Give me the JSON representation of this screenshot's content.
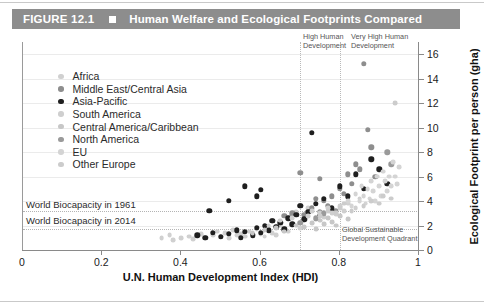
{
  "figure": {
    "number": "FIGURE 12.1",
    "marker": "square-marker",
    "title": "Human Welfare and Ecological Footprints Compared"
  },
  "legend": {
    "items": [
      {
        "label": "Africa",
        "color": "#d0d0d0"
      },
      {
        "label": "Middle East/Central Asia",
        "color": "#8e8e8e"
      },
      {
        "label": "Asia-Pacific",
        "color": "#1f1f1f"
      },
      {
        "label": "South America",
        "color": "#cfcfcf"
      },
      {
        "label": "Central America/Caribbean",
        "color": "#c7c7c7"
      },
      {
        "label": "North America",
        "color": "#9a9a9a"
      },
      {
        "label": "EU",
        "color": "#d4d4d4"
      },
      {
        "label": "Other Europe",
        "color": "#cccccc"
      }
    ]
  },
  "annotations": {
    "high_human_development": "High Human\nDevelopment",
    "high_human_development_line1": "High Human",
    "high_human_development_line2": "Development",
    "very_high_human_development_line1": "Very High Human",
    "very_high_human_development_line2": "Development",
    "biocapacity_1961": "World Biocapacity in 1961",
    "biocapacity_2014": "World Biocapacity in 2014",
    "quadrant_line1": "Global Sustainable",
    "quadrant_line2": "Development Quadrant"
  },
  "chart_data": {
    "type": "scatter",
    "title": "Human Welfare and Ecological Footprints Compared",
    "xlabel": "U.N. Human Development Index (HDI)",
    "ylabel": "Ecological Footprint per person (gha)",
    "xlim": [
      0,
      1
    ],
    "ylim": [
      0,
      17
    ],
    "xticks": [
      0,
      0.2,
      0.4,
      0.6,
      0.8,
      1
    ],
    "xtick_labels": [
      "0",
      "0.2",
      "0.4",
      "0.6",
      "0.8",
      "1"
    ],
    "yticks": [
      0,
      2,
      4,
      6,
      8,
      10,
      12,
      14,
      16
    ],
    "ytick_labels": [
      "0",
      "2",
      "4",
      "6",
      "8",
      "10",
      "12",
      "14",
      "16"
    ],
    "grid": true,
    "legend_position": "upper-left",
    "reference_lines": {
      "horizontal": [
        {
          "label": "World Biocapacity in 1961",
          "value": 3.2
        },
        {
          "label": "World Biocapacity in 2014",
          "value": 1.7
        }
      ],
      "vertical": [
        {
          "label": "High Human Development",
          "value": 0.7
        },
        {
          "label": "Very High Human Development",
          "value": 0.8
        }
      ]
    },
    "series": [
      {
        "name": "Africa",
        "color": "#d0d0d0",
        "points": [
          [
            0.4,
            1.0
          ],
          [
            0.42,
            1.1
          ],
          [
            0.43,
            0.9
          ],
          [
            0.45,
            1.3
          ],
          [
            0.46,
            1.0
          ],
          [
            0.48,
            1.2
          ],
          [
            0.49,
            1.5
          ],
          [
            0.5,
            1.1
          ],
          [
            0.51,
            1.4
          ],
          [
            0.52,
            1.0
          ],
          [
            0.53,
            1.6
          ],
          [
            0.54,
            1.2
          ],
          [
            0.55,
            1.3
          ],
          [
            0.56,
            1.1
          ],
          [
            0.57,
            1.5
          ],
          [
            0.58,
            1.2
          ],
          [
            0.59,
            1.7
          ],
          [
            0.6,
            1.3
          ],
          [
            0.61,
            1.1
          ],
          [
            0.62,
            1.6
          ],
          [
            0.63,
            1.4
          ],
          [
            0.64,
            1.2
          ],
          [
            0.65,
            2.0
          ],
          [
            0.67,
            1.5
          ],
          [
            0.69,
            3.1
          ],
          [
            0.7,
            1.8
          ],
          [
            0.72,
            3.4
          ],
          [
            0.35,
            1.0
          ],
          [
            0.37,
            1.2
          ],
          [
            0.38,
            0.8
          ]
        ]
      },
      {
        "name": "Middle East/Central Asia",
        "color": "#8e8e8e",
        "points": [
          [
            0.63,
            2.4
          ],
          [
            0.66,
            2.8
          ],
          [
            0.68,
            3.0
          ],
          [
            0.7,
            3.6
          ],
          [
            0.71,
            2.9
          ],
          [
            0.73,
            3.4
          ],
          [
            0.74,
            4.2
          ],
          [
            0.75,
            3.1
          ],
          [
            0.76,
            4.0
          ],
          [
            0.77,
            3.6
          ],
          [
            0.78,
            4.4
          ],
          [
            0.79,
            3.2
          ],
          [
            0.8,
            5.0
          ],
          [
            0.81,
            4.6
          ],
          [
            0.82,
            6.2
          ],
          [
            0.83,
            5.4
          ],
          [
            0.84,
            7.0
          ],
          [
            0.85,
            6.6
          ],
          [
            0.86,
            15.2
          ],
          [
            0.87,
            9.8
          ],
          [
            0.88,
            8.4
          ],
          [
            0.89,
            6.0
          ],
          [
            0.7,
            6.3
          ],
          [
            0.75,
            5.8
          ]
        ]
      },
      {
        "name": "Asia-Pacific",
        "color": "#1f1f1f",
        "points": [
          [
            0.44,
            1.2
          ],
          [
            0.46,
            1.0
          ],
          [
            0.48,
            1.4
          ],
          [
            0.5,
            1.1
          ],
          [
            0.52,
            1.3
          ],
          [
            0.54,
            1.6
          ],
          [
            0.55,
            1.0
          ],
          [
            0.56,
            1.5
          ],
          [
            0.58,
            1.2
          ],
          [
            0.59,
            1.8
          ],
          [
            0.6,
            1.4
          ],
          [
            0.61,
            2.0
          ],
          [
            0.62,
            1.6
          ],
          [
            0.63,
            2.4
          ],
          [
            0.64,
            1.9
          ],
          [
            0.65,
            2.2
          ],
          [
            0.66,
            1.7
          ],
          [
            0.67,
            2.6
          ],
          [
            0.68,
            2.1
          ],
          [
            0.69,
            2.9
          ],
          [
            0.7,
            3.6
          ],
          [
            0.71,
            2.5
          ],
          [
            0.72,
            3.1
          ],
          [
            0.73,
            9.6
          ],
          [
            0.74,
            3.8
          ],
          [
            0.75,
            2.8
          ],
          [
            0.76,
            4.2
          ],
          [
            0.78,
            3.4
          ],
          [
            0.8,
            5.2
          ],
          [
            0.82,
            4.4
          ],
          [
            0.84,
            6.2
          ],
          [
            0.86,
            5.0
          ],
          [
            0.88,
            7.4
          ],
          [
            0.9,
            6.6
          ],
          [
            0.92,
            5.4
          ],
          [
            0.56,
            5.2
          ],
          [
            0.59,
            4.4
          ],
          [
            0.52,
            4.0
          ],
          [
            0.47,
            3.2
          ],
          [
            0.6,
            4.9
          ]
        ]
      },
      {
        "name": "South America",
        "color": "#cfcfcf",
        "points": [
          [
            0.62,
            2.0
          ],
          [
            0.65,
            2.4
          ],
          [
            0.68,
            2.6
          ],
          [
            0.7,
            2.2
          ],
          [
            0.72,
            2.8
          ],
          [
            0.73,
            3.2
          ],
          [
            0.74,
            2.5
          ],
          [
            0.75,
            3.0
          ],
          [
            0.76,
            2.7
          ],
          [
            0.77,
            3.4
          ],
          [
            0.78,
            3.0
          ],
          [
            0.79,
            2.9
          ],
          [
            0.8,
            3.6
          ],
          [
            0.81,
            3.2
          ],
          [
            0.82,
            3.8
          ],
          [
            0.84,
            3.4
          ],
          [
            0.85,
            4.2
          ]
        ]
      },
      {
        "name": "Central America/Caribbean",
        "color": "#c7c7c7",
        "points": [
          [
            0.58,
            1.4
          ],
          [
            0.61,
            1.6
          ],
          [
            0.64,
            1.8
          ],
          [
            0.66,
            1.5
          ],
          [
            0.69,
            2.0
          ],
          [
            0.71,
            1.9
          ],
          [
            0.73,
            2.2
          ],
          [
            0.74,
            1.7
          ],
          [
            0.75,
            2.4
          ],
          [
            0.76,
            2.1
          ],
          [
            0.77,
            2.6
          ],
          [
            0.78,
            2.3
          ],
          [
            0.79,
            2.0
          ],
          [
            0.8,
            2.8
          ],
          [
            0.82,
            2.5
          ]
        ]
      },
      {
        "name": "North America",
        "color": "#9a9a9a",
        "points": [
          [
            0.92,
            8.0
          ],
          [
            0.93,
            7.0
          ],
          [
            0.7,
            2.2
          ],
          [
            0.74,
            2.6
          ],
          [
            0.76,
            3.0
          ]
        ]
      },
      {
        "name": "EU",
        "color": "#d4d4d4",
        "points": [
          [
            0.82,
            4.0
          ],
          [
            0.83,
            3.6
          ],
          [
            0.84,
            4.6
          ],
          [
            0.85,
            4.0
          ],
          [
            0.855,
            5.2
          ],
          [
            0.86,
            4.4
          ],
          [
            0.865,
            3.8
          ],
          [
            0.87,
            5.0
          ],
          [
            0.875,
            4.2
          ],
          [
            0.88,
            5.6
          ],
          [
            0.885,
            4.8
          ],
          [
            0.89,
            4.0
          ],
          [
            0.895,
            6.0
          ],
          [
            0.9,
            5.2
          ],
          [
            0.905,
            4.4
          ],
          [
            0.91,
            6.4
          ],
          [
            0.915,
            5.6
          ],
          [
            0.92,
            4.8
          ],
          [
            0.925,
            6.0
          ],
          [
            0.93,
            5.2
          ],
          [
            0.935,
            7.2
          ],
          [
            0.94,
            6.0
          ],
          [
            0.945,
            5.4
          ],
          [
            0.95,
            6.8
          ]
        ]
      },
      {
        "name": "Other Europe",
        "color": "#cccccc",
        "points": [
          [
            0.75,
            2.8
          ],
          [
            0.77,
            3.2
          ],
          [
            0.79,
            3.0
          ],
          [
            0.8,
            3.4
          ],
          [
            0.81,
            3.8
          ],
          [
            0.83,
            3.2
          ],
          [
            0.86,
            3.6
          ],
          [
            0.88,
            4.0
          ],
          [
            0.9,
            3.8
          ],
          [
            0.94,
            12.0
          ],
          [
            0.91,
            4.4
          ],
          [
            0.93,
            4.2
          ]
        ]
      }
    ]
  }
}
